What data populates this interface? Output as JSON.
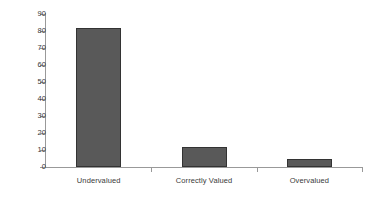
{
  "chart_data": {
    "type": "bar",
    "title": "",
    "subtitle": "",
    "xlabel": "",
    "ylabel": "",
    "categories": [
      "Undervalued",
      "Correctly Valued",
      "Overvalued"
    ],
    "values": [
      82,
      12,
      5
    ],
    "ylim": [
      0,
      90
    ],
    "ytick_step": 10,
    "yticks": [
      "90",
      "80",
      "70",
      "60",
      "50",
      "40",
      "30",
      "20",
      "10",
      "0"
    ],
    "grid": false,
    "legend": false,
    "legend_position": "none",
    "bar_color": "#595959",
    "bar_border_color": "#333333",
    "axis_color": "#999999",
    "text_color": "#3a3a3a",
    "background_color": "#ffffff"
  }
}
